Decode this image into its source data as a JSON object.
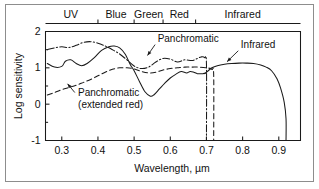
{
  "figure": {
    "background": "#ffffff",
    "border_color": "#8d8d8d",
    "line_color": "#1a1a1a"
  },
  "chart_data": {
    "type": "line",
    "title": "",
    "xlabel": "Wavelength, µm",
    "ylabel": "Log sensitivity",
    "xlim": [
      0.255,
      0.96
    ],
    "ylim": [
      -1,
      2
    ],
    "grid": false,
    "legend": "annotations-on-plot",
    "xticks": [
      0.3,
      0.4,
      0.5,
      0.6,
      0.7,
      0.8,
      0.9
    ],
    "xticklabels": [
      "0.3",
      "0.4",
      "0.5",
      "0.6",
      "0.7",
      "0.8",
      "0.9"
    ],
    "yticks": [
      -1,
      0,
      1,
      2
    ],
    "yticklabels": [
      "-1",
      "0",
      "1",
      "2"
    ],
    "top_axis": {
      "label": "Spectral bands",
      "boundaries": [
        0.255,
        0.4,
        0.5,
        0.58,
        0.67,
        0.96
      ],
      "bands": [
        {
          "name": "UV",
          "from": 0.255,
          "to": 0.4,
          "center": 0.325
        },
        {
          "name": "Blue",
          "from": 0.4,
          "to": 0.5,
          "center": 0.45
        },
        {
          "name": "Green",
          "from": 0.5,
          "to": 0.58,
          "center": 0.54
        },
        {
          "name": "Red",
          "from": 0.58,
          "to": 0.67,
          "center": 0.625
        },
        {
          "name": "Infrared",
          "from": 0.67,
          "to": 0.96,
          "center": 0.8
        }
      ]
    },
    "series": [
      {
        "name": "Panchromatic",
        "style": "dash-dot",
        "x": [
          0.26,
          0.28,
          0.3,
          0.32,
          0.34,
          0.36,
          0.38,
          0.4,
          0.42,
          0.44,
          0.46,
          0.48,
          0.5,
          0.52,
          0.54,
          0.56,
          0.58,
          0.6,
          0.62,
          0.64,
          0.66,
          0.675,
          0.685,
          0.695,
          0.7,
          0.7
        ],
        "y": [
          1.5,
          1.55,
          1.58,
          1.56,
          1.62,
          1.7,
          1.72,
          1.68,
          1.6,
          1.5,
          1.38,
          1.22,
          1.05,
          0.98,
          1.02,
          1.16,
          1.26,
          1.24,
          1.16,
          1.22,
          1.2,
          1.26,
          1.3,
          1.28,
          1.1,
          -1.0
        ]
      },
      {
        "name": "Panchromatic (extended red)",
        "style": "dashed",
        "x": [
          0.26,
          0.28,
          0.3,
          0.32,
          0.34,
          0.36,
          0.38,
          0.4,
          0.42,
          0.44,
          0.46,
          0.48,
          0.5,
          0.52,
          0.54,
          0.56,
          0.58,
          0.6,
          0.62,
          0.64,
          0.66,
          0.68,
          0.7,
          0.715,
          0.72,
          0.72
        ],
        "y": [
          0.25,
          0.32,
          0.4,
          0.46,
          0.52,
          0.6,
          0.68,
          0.78,
          0.88,
          0.96,
          1.0,
          1.0,
          0.97,
          0.9,
          0.86,
          0.88,
          0.94,
          0.98,
          1.0,
          1.02,
          1.02,
          1.02,
          1.0,
          0.96,
          0.8,
          -1.0
        ]
      },
      {
        "name": "Panchromatic-solid",
        "style": "solid",
        "x": [
          0.26,
          0.28,
          0.3,
          0.31,
          0.325,
          0.34,
          0.355,
          0.37,
          0.39,
          0.41,
          0.43,
          0.445,
          0.46,
          0.475,
          0.49,
          0.5,
          0.515,
          0.53,
          0.545,
          0.555,
          0.57,
          0.585,
          0.6,
          0.615,
          0.63,
          0.645,
          0.655,
          0.665,
          0.675,
          0.69,
          0.7
        ],
        "y": [
          1.12,
          1.02,
          1.04,
          1.18,
          1.22,
          1.12,
          1.06,
          1.12,
          1.28,
          1.48,
          1.58,
          1.6,
          1.55,
          1.38,
          1.08,
          0.92,
          0.62,
          0.34,
          0.22,
          0.26,
          0.42,
          0.58,
          0.72,
          0.82,
          0.9,
          0.86,
          0.9,
          0.88,
          0.84,
          0.84,
          0.86
        ]
      },
      {
        "name": "Infrared",
        "style": "solid",
        "x": [
          0.695,
          0.705,
          0.715,
          0.73,
          0.75,
          0.77,
          0.79,
          0.81,
          0.83,
          0.85,
          0.865,
          0.88,
          0.895,
          0.905,
          0.915,
          0.92,
          0.92
        ],
        "y": [
          0.84,
          0.92,
          1.0,
          1.06,
          1.1,
          1.12,
          1.13,
          1.13,
          1.12,
          1.08,
          1.02,
          0.92,
          0.7,
          0.44,
          0.05,
          -0.4,
          -1.0
        ]
      }
    ],
    "annotations": [
      {
        "id": "panchromatic-label",
        "text": "Panchromatic",
        "text_x": 0.565,
        "text_y": 1.72,
        "arrow_from_x": 0.558,
        "arrow_from_y": 1.64,
        "arrow_to_x": 0.537,
        "arrow_to_y": 1.34
      },
      {
        "id": "infrared-label",
        "text": "Infrared",
        "text_x": 0.795,
        "text_y": 1.55,
        "arrow_from_x": 0.788,
        "arrow_from_y": 1.47,
        "arrow_to_x": 0.757,
        "arrow_to_y": 1.17
      },
      {
        "id": "panchromatic-extended-red-label",
        "line1": "Panchromatic",
        "line2": "(extended red)",
        "text_x": 0.345,
        "text_y": 0.22,
        "arrow_from_x": 0.336,
        "arrow_from_y": 0.32,
        "arrow_to_x": 0.316,
        "arrow_to_y": 0.56
      }
    ]
  }
}
